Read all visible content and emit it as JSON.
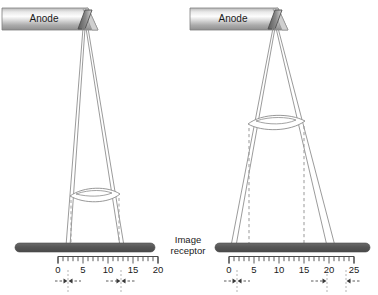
{
  "figure": {
    "background": "#ffffff",
    "line_color": "#8c8c8c",
    "dash_color": "#999999",
    "receptor_color": "#595959",
    "anode_target_color": "#6e6e6e",
    "text_color": "#1a1a1a"
  },
  "labels": {
    "receptor_line1": "Image",
    "receptor_line2": "receptor"
  },
  "panels": [
    {
      "id": "left",
      "anode_label": "Anode",
      "ruler": {
        "tick_labels": [
          "0",
          "5",
          "10",
          "15",
          "20"
        ],
        "min": 0,
        "max": 20,
        "major_step": 5,
        "minor_step": 1
      },
      "penumbra_markers": [
        {
          "position_label": "0",
          "value": 0
        },
        {
          "position_label": "12",
          "value": 12
        }
      ]
    },
    {
      "id": "right",
      "anode_label": "Anode",
      "ruler": {
        "tick_labels": [
          "0",
          "5",
          "10",
          "15",
          "20",
          "25"
        ],
        "min": 0,
        "max": 25,
        "major_step": 5,
        "minor_step": 1
      },
      "penumbra_markers": [
        {
          "position_label": "0",
          "value": 0
        },
        {
          "position_label": "21",
          "value": 21
        },
        {
          "position_label": "24",
          "value": 24
        }
      ]
    }
  ]
}
